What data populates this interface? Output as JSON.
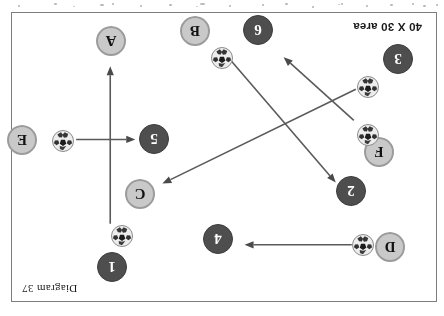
{
  "diagram": {
    "caption": "Diagram 37",
    "area_label": "40 X 30 area",
    "frame": {
      "x": 11,
      "y": 12,
      "width": 426,
      "height": 290
    },
    "orientation_note": "rotated-180",
    "colors": {
      "dark_marker": "#4e4e4e",
      "dark_marker_text": "#ffffff",
      "light_marker": "#c9c9c9",
      "light_marker_border": "#9b9b9b",
      "light_marker_text": "#121212",
      "frame_border": "#7d7d7d",
      "arrow": "#5a5a5a",
      "background": "#ffffff"
    },
    "markers": [
      {
        "id": "m-1",
        "label": "1",
        "style": "dark",
        "x": 309,
        "y": 19
      },
      {
        "id": "m-4",
        "label": "4",
        "style": "dark",
        "x": 203,
        "y": 47
      },
      {
        "id": "m-D",
        "label": "D",
        "style": "light",
        "x": 31,
        "y": 39
      },
      {
        "id": "m-2",
        "label": "2",
        "style": "dark",
        "x": 70,
        "y": 95
      },
      {
        "id": "m-C",
        "label": "C",
        "style": "light",
        "x": 281,
        "y": 92
      },
      {
        "id": "m-F",
        "label": "F",
        "style": "light",
        "x": 42,
        "y": 134
      },
      {
        "id": "m-5",
        "label": "5",
        "style": "dark",
        "x": 267,
        "y": 147
      },
      {
        "id": "m-E",
        "label": "E",
        "style": "light",
        "x": 399,
        "y": 146
      },
      {
        "id": "m-3",
        "label": "3",
        "style": "dark",
        "x": 23,
        "y": 227
      },
      {
        "id": "m-A",
        "label": "A",
        "style": "light",
        "x": 310,
        "y": 245
      },
      {
        "id": "m-6",
        "label": "6",
        "style": "dark",
        "x": 163,
        "y": 256
      },
      {
        "id": "m-B",
        "label": "B",
        "style": "light",
        "x": 226,
        "y": 255
      }
    ],
    "balls": [
      {
        "id": "ball-d",
        "x": 62,
        "y": 45
      },
      {
        "id": "ball-1",
        "x": 303,
        "y": 54
      },
      {
        "id": "ball-f",
        "x": 57,
        "y": 155
      },
      {
        "id": "ball-e",
        "x": 362,
        "y": 149
      },
      {
        "id": "ball-3",
        "x": 57,
        "y": 203
      },
      {
        "id": "ball-b",
        "x": 203,
        "y": 232
      }
    ],
    "arrows": [
      {
        "id": "arrow-d-to-4",
        "x1": 84,
        "y1": 56,
        "x2": 191,
        "y2": 56
      },
      {
        "id": "arrow-1-to-A",
        "x1": 325,
        "y1": 77,
        "x2": 325,
        "y2": 234
      },
      {
        "id": "arrow-e-to-5",
        "x1": 359,
        "y1": 161,
        "x2": 300,
        "y2": 161
      },
      {
        "id": "arrow-3-to-C",
        "x1": 80,
        "y1": 211,
        "x2": 273,
        "y2": 117
      },
      {
        "id": "arrow-b-to-2",
        "x1": 204,
        "y1": 239,
        "x2": 100,
        "y2": 118
      },
      {
        "id": "arrow-f-to-open",
        "x1": 82,
        "y1": 180,
        "x2": 152,
        "y2": 243
      }
    ]
  }
}
